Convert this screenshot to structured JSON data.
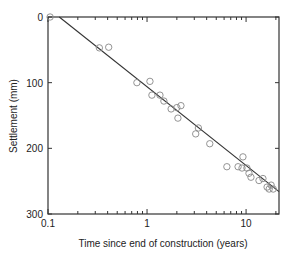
{
  "chart_data": {
    "type": "scatter",
    "title": "",
    "xlabel": "Time since end of construction (years)",
    "ylabel": "Settlement (mm)",
    "xscale": "log",
    "xlim": [
      0.1,
      21.5
    ],
    "ylim": [
      300,
      0
    ],
    "y_inverted": true,
    "grid": false,
    "legend": null,
    "x_tick_labels": [
      "0.1",
      "1",
      "10"
    ],
    "x_ticks": [
      0.1,
      1,
      10
    ],
    "y_tick_labels": [
      "0",
      "100",
      "200",
      "300"
    ],
    "y_ticks": [
      0,
      100,
      200,
      300
    ],
    "series": [
      {
        "name": "Measured settlement",
        "marker": "open-circle",
        "color": "#888888",
        "points": [
          {
            "x": 0.105,
            "y": 0
          },
          {
            "x": 0.33,
            "y": 47
          },
          {
            "x": 0.41,
            "y": 46
          },
          {
            "x": 0.79,
            "y": 100
          },
          {
            "x": 1.07,
            "y": 98
          },
          {
            "x": 1.12,
            "y": 119
          },
          {
            "x": 1.35,
            "y": 119
          },
          {
            "x": 1.48,
            "y": 128
          },
          {
            "x": 1.75,
            "y": 140
          },
          {
            "x": 2.0,
            "y": 138
          },
          {
            "x": 2.05,
            "y": 154
          },
          {
            "x": 2.2,
            "y": 135
          },
          {
            "x": 3.1,
            "y": 178
          },
          {
            "x": 3.3,
            "y": 169
          },
          {
            "x": 4.3,
            "y": 193
          },
          {
            "x": 6.4,
            "y": 228
          },
          {
            "x": 8.3,
            "y": 228
          },
          {
            "x": 9.1,
            "y": 230
          },
          {
            "x": 9.3,
            "y": 213
          },
          {
            "x": 10.2,
            "y": 230
          },
          {
            "x": 10.7,
            "y": 238
          },
          {
            "x": 11.2,
            "y": 244
          },
          {
            "x": 13.5,
            "y": 249
          },
          {
            "x": 14.8,
            "y": 246
          },
          {
            "x": 16.3,
            "y": 259
          },
          {
            "x": 17.1,
            "y": 262
          },
          {
            "x": 17.9,
            "y": 256
          },
          {
            "x": 18.8,
            "y": 262
          }
        ]
      },
      {
        "name": "Best-fit line",
        "type": "line",
        "color": "#333333",
        "points": [
          {
            "x": 0.13,
            "y": 0
          },
          {
            "x": 21.5,
            "y": 266
          }
        ]
      }
    ]
  }
}
